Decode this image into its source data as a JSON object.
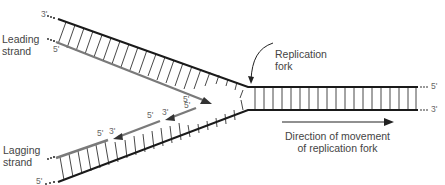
{
  "diagram": {
    "labels": {
      "leading_strand": "Leading\nstrand",
      "leading_line1": "Leading",
      "leading_line2": "strand",
      "lagging_line1": "Lagging",
      "lagging_line2": "strand",
      "replication_fork_line1": "Replication",
      "replication_fork_line2": "fork",
      "direction_line1": "Direction of movement",
      "direction_line2": "of replication fork"
    },
    "end_labels": {
      "top_left_parent": "3'",
      "leading_new_start": "5'",
      "leading_new_end": "5'",
      "okazaki1_5": "5'",
      "okazaki1_3": "3'",
      "okazaki2_5": "5'",
      "okazaki2_3": "3'",
      "okazaki3_5": "5'",
      "bottom_left_parent": "5'",
      "right_top": "5'",
      "right_bottom": "3'"
    },
    "colors": {
      "parent_strand": "#1a1a1a",
      "new_strand": "#7a7a7a",
      "rungs": "#333333",
      "text": "#444444"
    }
  }
}
